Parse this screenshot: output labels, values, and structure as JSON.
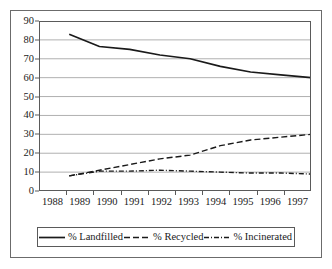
{
  "chart_data": {
    "type": "line",
    "title": "",
    "xlabel": "",
    "ylabel": "",
    "x": [
      1988,
      1989,
      1990,
      1991,
      1992,
      1993,
      1994,
      1995,
      1996,
      1997
    ],
    "categories": [
      "1988",
      "1989",
      "1990",
      "1991",
      "1992",
      "1993",
      "1994",
      "1995",
      "1996",
      "1997"
    ],
    "xlim": [
      1988,
      1997
    ],
    "ylim": [
      0,
      90
    ],
    "ytick_labels": [
      "0",
      "10",
      "20",
      "30",
      "40",
      "50",
      "60",
      "70",
      "80",
      "90"
    ],
    "ytick_values": [
      0,
      10,
      20,
      30,
      40,
      50,
      60,
      70,
      80,
      90
    ],
    "ytick_step": 10,
    "grid": true,
    "grid_axis": "y",
    "legend_position": "bottom",
    "series": [
      {
        "name": "% Landfilled",
        "style": "solid",
        "color": "#1a1a1a",
        "x": [
          1989,
          1990,
          1991,
          1992,
          1993,
          1994,
          1995,
          1996,
          1997
        ],
        "values": [
          83,
          76.5,
          75,
          72,
          70,
          66,
          63,
          61.5,
          60
        ]
      },
      {
        "name": "% Recycled",
        "style": "dashed",
        "color": "#1a1a1a",
        "x": [
          1989,
          1990,
          1991,
          1992,
          1993,
          1994,
          1995,
          1996,
          1997
        ],
        "values": [
          8,
          11,
          14,
          17,
          19,
          24,
          27,
          28.5,
          30
        ]
      },
      {
        "name": "% Incinerated",
        "style": "dash-dot",
        "color": "#1a1a1a",
        "x": [
          1989,
          1990,
          1991,
          1992,
          1993,
          1994,
          1995,
          1996,
          1997
        ],
        "values": [
          8,
          10.5,
          10.5,
          11,
          10.5,
          10,
          9.5,
          9.5,
          9
        ]
      }
    ]
  },
  "legend": {
    "items": [
      {
        "label": "% Landfilled",
        "style": "solid"
      },
      {
        "label": "% Recycled",
        "style": "dashed"
      },
      {
        "label": "% Incinerated",
        "style": "dash-dot"
      }
    ]
  },
  "colors": {
    "line": "#1a1a1a",
    "grid": "#b0b0b0",
    "frame": "#5a5a5a",
    "outer_frame": "#6b6b6b",
    "background": "#ffffff"
  }
}
